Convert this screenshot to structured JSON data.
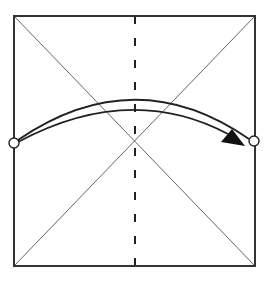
{
  "diagram": {
    "type": "origami-fold-step",
    "description": "Square paper with diagonal creases, vertical valley fold line, and arrow folding left edge to right edge",
    "colors": {
      "background": "#ffffff",
      "edge": "#333333",
      "crease": "#555555",
      "fold_line": "#222222",
      "arrow": "#222222"
    },
    "square": {
      "x1": 14,
      "y1": 16,
      "x2": 255,
      "y2": 266
    },
    "creases": [
      {
        "name": "diagonal-tl-br",
        "x1": 14,
        "y1": 16,
        "x2": 255,
        "y2": 266
      },
      {
        "name": "diagonal-tr-bl",
        "x1": 255,
        "y1": 16,
        "x2": 14,
        "y2": 266
      }
    ],
    "valley_fold": {
      "x": 135,
      "y1": 16,
      "y2": 266,
      "dash": "8 14"
    },
    "reference_points": [
      {
        "name": "left-point",
        "cx": 14,
        "cy": 143,
        "r": 5
      },
      {
        "name": "right-point",
        "cx": 254,
        "cy": 141,
        "r": 5
      }
    ],
    "arrow": {
      "upper_curve": "M 18 140 Q 135 60 249 139",
      "lower_curve": "M 18 142 Q 130 82 228 134",
      "head": "221,142 245,146 232,129"
    }
  }
}
